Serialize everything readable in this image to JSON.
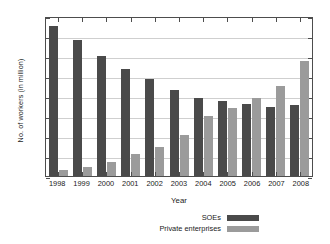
{
  "chart_data": {
    "type": "bar",
    "title": "",
    "xlabel": "Year",
    "ylabel": "No. of workers (in million)",
    "categories": [
      "1998",
      "1999",
      "2000",
      "2001",
      "2002",
      "2003",
      "2004",
      "2005",
      "2006",
      "2007",
      "2008"
    ],
    "series": [
      {
        "name": "SOEs",
        "color": "#4a4a4a",
        "values": [
          37.5,
          34.0,
          29.9,
          26.7,
          24.2,
          21.5,
          19.6,
          18.7,
          17.9,
          17.3,
          17.8
        ]
      },
      {
        "name": "Private enterprises",
        "color": "#9b9b9b",
        "values": [
          1.6,
          2.3,
          3.5,
          5.4,
          7.2,
          10.2,
          15.1,
          16.9,
          19.6,
          22.5,
          28.7
        ]
      }
    ],
    "ylim": [
      0,
      40
    ],
    "yticks": [
      "0",
      "5",
      "10",
      "15",
      "20",
      "25",
      "30",
      "35",
      "40"
    ],
    "ytick_values": [
      0,
      5,
      10,
      15,
      20,
      25,
      30,
      35,
      40
    ],
    "grid": true,
    "legend_position": "bottom-center"
  }
}
